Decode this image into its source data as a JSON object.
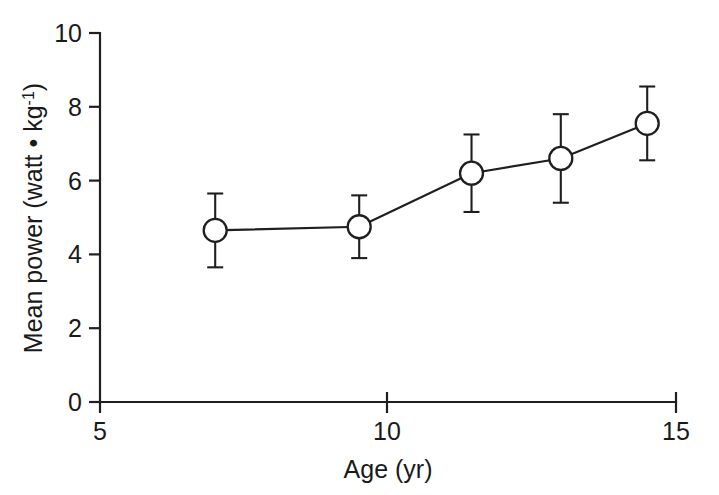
{
  "chart_data": {
    "type": "line",
    "title": "",
    "xlabel": "Age (yr)",
    "ylabel": "Mean power (watt • kg⁻¹)",
    "ylabel_parts": {
      "main": "Mean power (watt • kg",
      "superscript": "-1",
      "tail": ")"
    },
    "xlim": [
      5,
      15
    ],
    "ylim": [
      0,
      10
    ],
    "xticks": [
      5,
      10,
      15
    ],
    "xtick_labels": [
      "5",
      "10",
      "15"
    ],
    "yticks": [
      0,
      2,
      4,
      6,
      8,
      10
    ],
    "ytick_labels": [
      "0",
      "2",
      "4",
      "6",
      "8",
      "10"
    ],
    "grid": false,
    "legend": "none",
    "marker": "open-circle",
    "errorbars": true,
    "x": [
      7.0,
      9.5,
      11.45,
      13.0,
      14.5
    ],
    "values": [
      4.65,
      4.75,
      6.2,
      6.6,
      7.55
    ],
    "yerr": [
      1.0,
      0.85,
      1.05,
      1.2,
      1.0
    ],
    "series": [
      {
        "name": "Mean power",
        "x": [
          7.0,
          9.5,
          11.45,
          13.0,
          14.5
        ],
        "values": [
          4.65,
          4.75,
          6.2,
          6.6,
          7.55
        ],
        "yerr": [
          1.0,
          0.85,
          1.05,
          1.2,
          1.0
        ]
      }
    ],
    "colors": {
      "line": "#1f1f1f",
      "marker_fill": "#ffffff",
      "marker_stroke": "#1f1f1f",
      "axis": "#1f1f1f",
      "background": "#ffffff"
    }
  }
}
